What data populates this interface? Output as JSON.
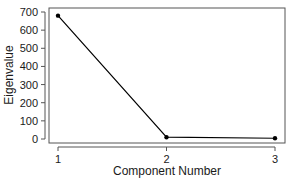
{
  "chart_data": {
    "type": "line",
    "title": "",
    "xlabel": "Component Number",
    "ylabel": "Eigenvalue",
    "x": [
      1,
      2,
      3
    ],
    "categories": [
      "1",
      "2",
      "3"
    ],
    "series": [
      {
        "name": "Eigenvalue",
        "values": [
          680,
          10,
          4
        ],
        "marker": "circle",
        "color": "#000000"
      }
    ],
    "ylim": [
      0,
      700
    ],
    "yticks": [
      0,
      100,
      200,
      300,
      400,
      500,
      600,
      700
    ],
    "xticks": [
      1,
      2,
      3
    ],
    "grid": false,
    "legend": null
  },
  "labels": {
    "xlabel": "Component Number",
    "ylabel": "Eigenvalue",
    "yticks": [
      "0",
      "100",
      "200",
      "300",
      "400",
      "500",
      "600",
      "700"
    ],
    "xticks": [
      "1",
      "2",
      "3"
    ]
  },
  "colors": {
    "line": "#000000",
    "frame": "#555555",
    "text": "#1a1a1a"
  }
}
